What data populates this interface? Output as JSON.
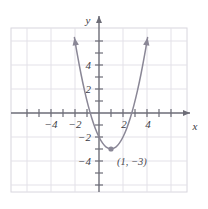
{
  "figure": {
    "name": "parabola-graph",
    "background": "#ffffff"
  },
  "colors": {
    "grid": "#e3e1e8",
    "grid_border": "#d8d6de",
    "axis": "#6d6d77",
    "curve": "#8a8796",
    "label": "#3b3b44",
    "point": "#8a8796"
  },
  "axes": {
    "x_name": "x",
    "y_name": "y",
    "x_ticks": [
      {
        "value": -4,
        "label": "−4"
      },
      {
        "value": -2,
        "label": "−2"
      },
      {
        "value": 2,
        "label": "2"
      },
      {
        "value": 4,
        "label": "4"
      }
    ],
    "y_ticks": [
      {
        "value": 4,
        "label": "4"
      },
      {
        "value": 2,
        "label": "2"
      },
      {
        "value": -2,
        "label": "−2"
      },
      {
        "value": -4,
        "label": "−4"
      }
    ]
  },
  "annotations": {
    "vertex_label": "(1, −3)"
  },
  "chart_data": {
    "type": "line",
    "title": "",
    "xlabel": "x",
    "ylabel": "y",
    "xlim": [
      -7.3,
      7.2
    ],
    "ylim": [
      -5.9,
      6.9
    ],
    "grid": true,
    "grid_step": 2,
    "tick_step": 1,
    "legend": "none",
    "series": [
      {
        "name": "y = (x - 1)^2 - 3",
        "equation": "y=(x-1)^2-3",
        "vertex": [
          1,
          -3
        ],
        "x_intercepts": [
          -0.732,
          2.732
        ],
        "y_intercept": -2,
        "x": [
          -2.05,
          -1.8,
          -1.5,
          -1.2,
          -0.9,
          -0.6,
          -0.3,
          0,
          0.3,
          0.6,
          1,
          1.4,
          1.7,
          2,
          2.3,
          2.6,
          2.9,
          3.2,
          3.5,
          3.8,
          4.05
        ],
        "y": [
          6.3,
          4.84,
          3.25,
          1.84,
          0.61,
          -0.44,
          -1.31,
          -2,
          -2.51,
          -2.84,
          -3,
          -2.84,
          -2.51,
          -2,
          -1.31,
          -0.44,
          0.61,
          1.84,
          3.25,
          4.84,
          6.3
        ]
      }
    ],
    "points": [
      {
        "label": "(1, −3)",
        "x": 1,
        "y": -3,
        "marked": true
      }
    ],
    "arrows": [
      "x-positive",
      "y-positive",
      "curve-left-up",
      "curve-right-up"
    ]
  }
}
